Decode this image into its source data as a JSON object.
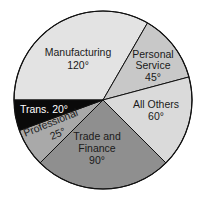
{
  "chart_data": {
    "type": "pie",
    "title": "",
    "unit": "degrees",
    "categories": [
      "Manufacturing",
      "Personal Service",
      "All Others",
      "Trade and Finance",
      "Professional",
      "Trans."
    ],
    "values": [
      120,
      45,
      60,
      90,
      25,
      20
    ],
    "labels": [
      "120°",
      "45°",
      "60°",
      "90°",
      "25°",
      "20°"
    ],
    "colors": [
      "#e3e3e3",
      "#c8c8c8",
      "#dadada",
      "#8f8f8f",
      "#a9a9a9",
      "#0a0a0a"
    ],
    "start_angle_deg": 180,
    "direction": "clockwise"
  },
  "slices": {
    "manufacturing": {
      "name": "Manufacturing",
      "value": "120°"
    },
    "personal": {
      "name1": "Personal",
      "name2": "Service",
      "value": "45°"
    },
    "others": {
      "name": "All Others",
      "value": "60°"
    },
    "trade": {
      "name1": "Trade and",
      "name2": "Finance",
      "value": "90°"
    },
    "professional": {
      "name": "Professional",
      "value": "25°"
    },
    "trans": {
      "label": "Trans. 20°"
    }
  }
}
